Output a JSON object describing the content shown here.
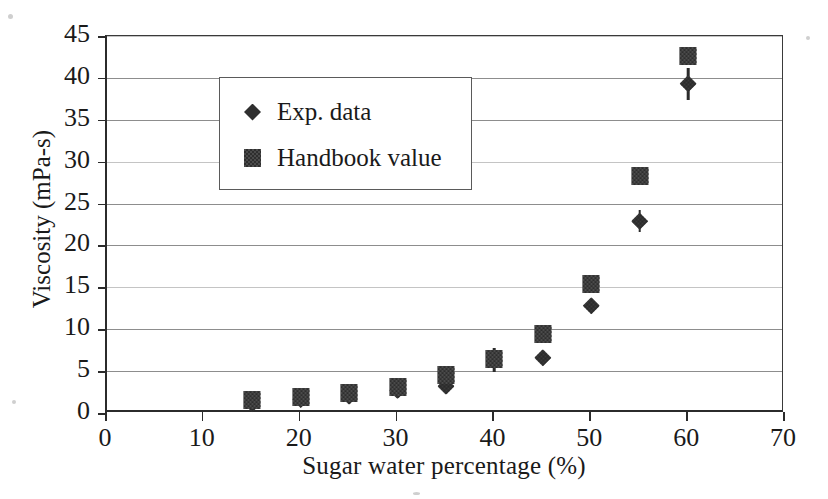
{
  "chart_data": {
    "type": "scatter",
    "title": "",
    "xlabel": "Sugar water percentage (%)",
    "ylabel": "Viscosity (mPa-s)",
    "xlim": [
      0,
      70
    ],
    "ylim": [
      0,
      45
    ],
    "xticks": [
      0,
      10,
      20,
      30,
      40,
      50,
      60,
      70
    ],
    "yticks": [
      0,
      5,
      10,
      15,
      20,
      25,
      30,
      35,
      40,
      45
    ],
    "grid": "horizontal",
    "legend_position": "upper-left",
    "x": [
      15,
      20,
      25,
      30,
      35,
      40,
      45,
      50,
      55,
      60
    ],
    "series": [
      {
        "name": "Exp. data",
        "marker": "diamond",
        "values": [
          1.1,
          1.6,
          2.0,
          2.7,
          3.2,
          6.3,
          6.6,
          12.8,
          22.9,
          39.3
        ],
        "errors": [
          0.4,
          0.4,
          0.5,
          0.5,
          0.7,
          1.4,
          0.4,
          0.5,
          1.3,
          1.9
        ]
      },
      {
        "name": "Handbook value",
        "marker": "square",
        "values": [
          1.6,
          1.9,
          2.4,
          3.1,
          4.5,
          6.5,
          9.4,
          15.4,
          28.3,
          42.6
        ],
        "errors": [
          0,
          0,
          0,
          0,
          0,
          0,
          0,
          0,
          0,
          0
        ]
      }
    ]
  },
  "legend": {
    "items": [
      {
        "label": "Exp. data",
        "marker": "diamond-icon"
      },
      {
        "label": "Handbook value",
        "marker": "square-icon"
      }
    ]
  },
  "axes": {
    "x_tick_labels": [
      "0",
      "10",
      "20",
      "30",
      "40",
      "50",
      "60",
      "70"
    ],
    "y_tick_labels": [
      "0",
      "5",
      "10",
      "15",
      "20",
      "25",
      "30",
      "35",
      "40",
      "45"
    ],
    "x_title": "Sugar water percentage (%)",
    "y_title": "Viscosity (mPa-s)"
  },
  "colors": {
    "marker": "#3a3a3a",
    "axis": "#2b2b2b",
    "grid": "#8d8d8d",
    "background": "#ffffff"
  }
}
